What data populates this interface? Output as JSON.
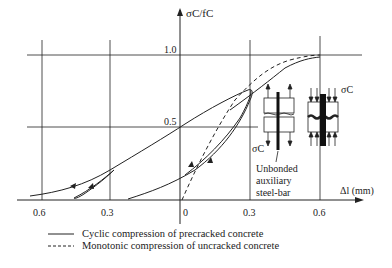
{
  "diagram": {
    "y_axis_label": "σC/fC",
    "x_axis_label": "Δl (mm)",
    "y_ticks": [
      "1.0",
      "0.5"
    ],
    "x_ticks": [
      "0.6",
      "0.3",
      "0",
      "0.3",
      "0.6"
    ],
    "sigma_label_top": "σC",
    "sigma_label_bottom": "σC",
    "annotation": [
      "Unbonded",
      "auxiliary",
      "steel-bar"
    ],
    "legend": [
      {
        "style": "solid",
        "label": "Cyclic compression of precracked concrete"
      },
      {
        "style": "dashed",
        "label": "Monotonic compression of uncracked concrete"
      }
    ],
    "colors": {
      "line": "#222222",
      "background": "#ffffff"
    }
  }
}
